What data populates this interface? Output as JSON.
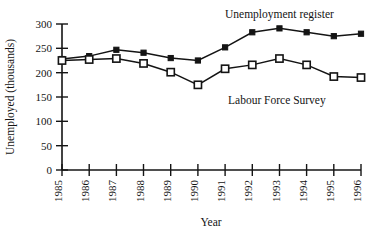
{
  "chart_data": {
    "type": "line",
    "title": "",
    "xlabel": "Year",
    "ylabel": "Unemployed (thousands)",
    "categories": [
      "1985",
      "1986",
      "1987",
      "1988",
      "1989",
      "1990",
      "1991",
      "1992",
      "1993",
      "1994",
      "1995",
      "1996"
    ],
    "x": [
      1985,
      1986,
      1987,
      1988,
      1989,
      1990,
      1991,
      1992,
      1993,
      1994,
      1995,
      1996
    ],
    "xlim": [
      1985,
      1996
    ],
    "ylim": [
      0,
      300
    ],
    "yticks": [
      0,
      50,
      100,
      150,
      200,
      250,
      300
    ],
    "ytick_labels": [
      "0",
      "50",
      "100",
      "150",
      "200",
      "250",
      "300"
    ],
    "grid": false,
    "legend": "inline-annotations",
    "series": [
      {
        "name": "Unemployment register",
        "marker": "filled-square",
        "color": "#141414",
        "values": [
          228,
          234,
          247,
          241,
          230,
          225,
          252,
          283,
          291,
          283,
          275,
          280
        ]
      },
      {
        "name": "Labour Force Survey",
        "marker": "open-square",
        "color": "#141414",
        "values": [
          225,
          227,
          229,
          219,
          201,
          175,
          208,
          216,
          229,
          216,
          192,
          190
        ]
      }
    ],
    "annotations": [
      {
        "text": "Unemployment register",
        "series": "Unemployment register"
      },
      {
        "text": "Labour Force Survey",
        "series": "Labour Force Survey"
      }
    ]
  }
}
